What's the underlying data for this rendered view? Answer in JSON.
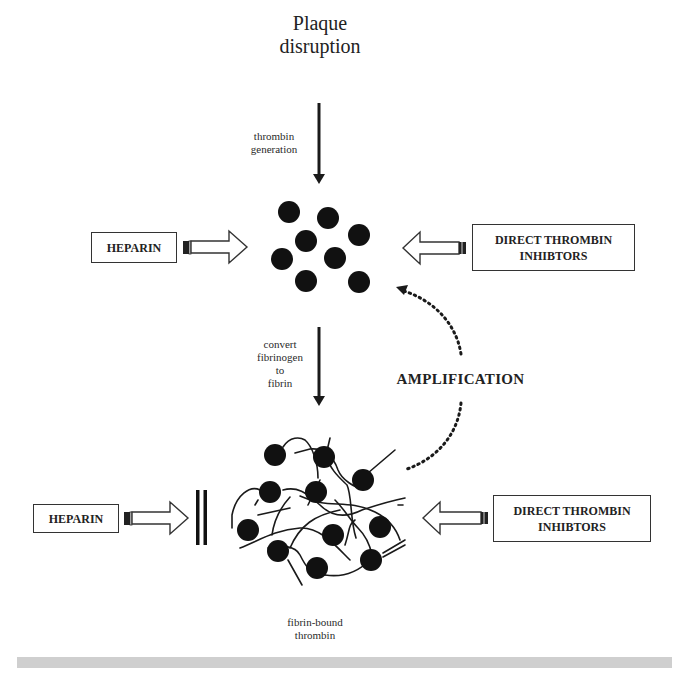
{
  "figure": {
    "title_line1": "Plaque",
    "title_line2": "disruption",
    "step1_line1": "thrombin",
    "step1_line2": "generation",
    "step2_line1": "convert",
    "step2_line2": "fibrinogen",
    "step2_line3": "to",
    "step2_line4": "fibrin",
    "amplification_label": "AMPLIFICATION",
    "bottom_label_line1": "fibrin-bound",
    "bottom_label_line2": "thrombin"
  },
  "top_row": {
    "left_box": {
      "label": "HEPARIN"
    },
    "right_box": {
      "line1": "DIRECT THROMBIN",
      "line2": "INHIBTORS"
    }
  },
  "bottom_row": {
    "left_box": {
      "label": "HEPARIN"
    },
    "right_box": {
      "line1": "DIRECT THROMBIN",
      "line2": "INHIBTORS"
    }
  },
  "colors": {
    "ink": "#1a1a1a",
    "background": "#ffffff",
    "footer_bar": "#cfcfcf"
  },
  "icons": {
    "free_thrombin": "filled-circle",
    "fibrin_network": "tangled-lines",
    "block": "double-vertical-bar",
    "inhibit_arrow": "hollow-block-arrow"
  }
}
